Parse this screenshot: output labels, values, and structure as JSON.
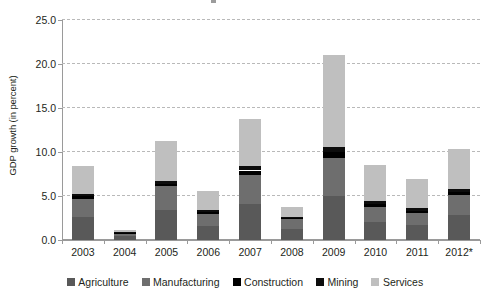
{
  "chart_data": {
    "type": "bar",
    "stacked": true,
    "title": "",
    "xlabel": "",
    "ylabel": "GDP growth (in percent)",
    "ylim": [
      0.0,
      25.0
    ],
    "ytick_labels": [
      "0.0",
      "5.0",
      "10.0",
      "15.0",
      "20.0",
      "25.0"
    ],
    "ytick_values": [
      0.0,
      5.0,
      10.0,
      15.0,
      20.0,
      25.0
    ],
    "grid": "horizontal-dashed",
    "legend_position": "bottom",
    "categories": [
      "2003",
      "2004",
      "2005",
      "2006",
      "2007",
      "2008",
      "2009",
      "2010",
      "2011",
      "2012*"
    ],
    "series": [
      {
        "name": "Agriculture",
        "color": "#595959",
        "values": [
          2.6,
          0.4,
          3.4,
          1.6,
          4.1,
          1.3,
          5.0,
          2.1,
          1.7,
          2.8
        ]
      },
      {
        "name": "Manufacturing",
        "color": "#6e6e6e",
        "values": [
          2.1,
          0.3,
          2.7,
          1.3,
          3.3,
          1.1,
          4.3,
          1.7,
          1.4,
          2.3
        ]
      },
      {
        "name": "Construction",
        "color": "#000000",
        "values": [
          0.25,
          0.1,
          0.3,
          0.25,
          0.5,
          0.12,
          0.7,
          0.3,
          0.25,
          0.35
        ]
      },
      {
        "name": "Mining",
        "color": "#0d0d0d",
        "values": [
          0.25,
          0.1,
          0.3,
          0.25,
          0.5,
          0.13,
          0.6,
          0.3,
          0.25,
          0.35
        ]
      },
      {
        "name": "Services",
        "color": "#bfbfbf",
        "values": [
          3.2,
          0.2,
          4.5,
          2.2,
          5.3,
          1.05,
          10.4,
          4.1,
          3.3,
          4.5
        ]
      }
    ],
    "totals": [
      8.4,
      1.1,
      11.2,
      5.6,
      13.7,
      3.7,
      21.0,
      8.5,
      6.9,
      10.3
    ]
  },
  "legend": {
    "items": [
      {
        "label": "Agriculture",
        "color": "#595959"
      },
      {
        "label": "Manufacturing",
        "color": "#6e6e6e"
      },
      {
        "label": "Construction",
        "color": "#000000"
      },
      {
        "label": "Mining",
        "color": "#0d0d0d"
      },
      {
        "label": "Services",
        "color": "#bfbfbf"
      }
    ]
  }
}
